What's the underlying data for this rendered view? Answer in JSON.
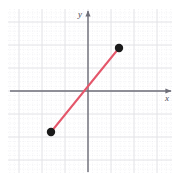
{
  "figure": {
    "width": 178,
    "height": 182,
    "background": "#ffffff",
    "type": "coordinate-grid-line-segment"
  },
  "axes": {
    "x_label": "x",
    "y_label": "y",
    "axis_color": "#6e6e78",
    "x_axis": {
      "y_pixel": 91,
      "x_start_pixel": 10,
      "x_end_pixel": 171,
      "arrow": "right"
    },
    "y_axis": {
      "x_pixel": 88,
      "y_start_pixel": 172,
      "y_end_pixel": 11,
      "arrow": "up"
    }
  },
  "grid": {
    "major_color": "#e2e2e6",
    "minor_color": "#e8e8ec",
    "minor_style": "dotted",
    "cell_pixels": 23,
    "minor_subdivisions": 5,
    "left_pixel": 8,
    "right_pixel": 172,
    "top_pixel": 9,
    "bottom_pixel": 173,
    "origin_x_pixel": 88,
    "origin_y_pixel": 91,
    "visible": true
  },
  "chart_data": {
    "type": "line",
    "title": "",
    "xlabel": "x",
    "ylabel": "y",
    "grid": true,
    "legend": "none",
    "xlim": [
      -3.5,
      3.6
    ],
    "ylim": [
      -3.6,
      3.6
    ],
    "series": [
      {
        "name": "segment",
        "color": "#e4566a",
        "linewidth": 2,
        "x": [
          -1.6,
          1.35
        ],
        "y": [
          -1.8,
          1.85
        ],
        "endpoint_marker": "filled-circle",
        "endpoint_color": "#1a1a1a"
      }
    ],
    "points": [
      {
        "label": "lower-left-endpoint",
        "x": -1.6,
        "y": -1.8,
        "pixel_x": 51,
        "pixel_y": 132
      },
      {
        "label": "upper-right-endpoint",
        "x": 1.35,
        "y": 1.85,
        "pixel_x": 119,
        "pixel_y": 48
      }
    ]
  },
  "colors": {
    "segment": "#e4566a",
    "marker": "#1a1a1a",
    "axis": "#6e6e78",
    "grid_major": "#e2e2e6",
    "grid_minor": "#e8e8ec"
  }
}
